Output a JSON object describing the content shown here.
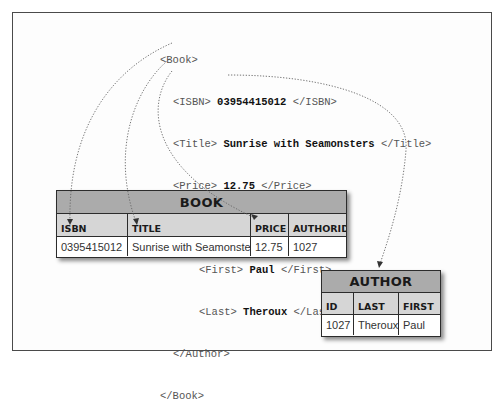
{
  "xml": {
    "lines": [
      {
        "indent": 0,
        "open": "<Book>",
        "value": "",
        "close": ""
      },
      {
        "indent": 1,
        "open": "<ISBN> ",
        "value": "03954415012",
        "close": " </ISBN>"
      },
      {
        "indent": 1,
        "open": "<Title> ",
        "value": "Sunrise with Seamonsters",
        "close": " </Title>"
      },
      {
        "indent": 1,
        "open": "<Price> ",
        "value": "12.75",
        "close": " </Price>"
      },
      {
        "indent": 1,
        "open": "<Author>",
        "value": "",
        "close": ""
      },
      {
        "indent": 2,
        "open": "<First> ",
        "value": "Paul",
        "close": " </First>"
      },
      {
        "indent": 2,
        "open": "<Last> ",
        "value": "Theroux",
        "close": " </Last>"
      },
      {
        "indent": 1,
        "open": "</Author>",
        "value": "",
        "close": ""
      },
      {
        "indent": 0,
        "open": "</Book>",
        "value": "",
        "close": ""
      }
    ]
  },
  "book_table": {
    "title": "BOOK",
    "columns": [
      "ISBN",
      "TITLE",
      "PRICE",
      "AUTHORID"
    ],
    "row": [
      "0395415012",
      "Sunrise with Seamonsters",
      "12.75",
      "1027"
    ]
  },
  "author_table": {
    "title": "AUTHOR",
    "columns": [
      "ID",
      "LAST",
      "FIRST"
    ],
    "row": [
      "1027",
      "Theroux",
      "Paul"
    ]
  },
  "mappings": [
    {
      "from": "ISBN",
      "to": "BOOK.ISBN"
    },
    {
      "from": "Title",
      "to": "BOOK.TITLE"
    },
    {
      "from": "Price",
      "to": "BOOK.PRICE"
    },
    {
      "from": "Author",
      "to": "AUTHOR"
    }
  ],
  "colors": {
    "table_band": "#ababab",
    "table_header_row": "#d6d6d6",
    "border": "#2c2c2c"
  }
}
